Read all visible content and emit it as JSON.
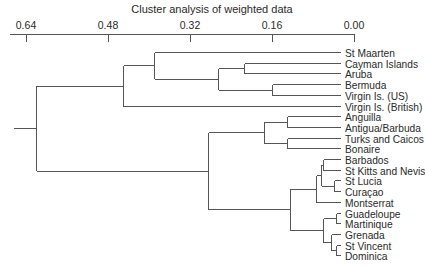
{
  "chart_data": {
    "type": "dendrogram",
    "title": "Cluster analysis of weighted data",
    "xlabel": "",
    "ylabel": "",
    "axis": {
      "position": "top",
      "direction": "reversed",
      "range": [
        0.64,
        0.0
      ],
      "ticks": [
        0.64,
        0.48,
        0.32,
        0.16,
        0.0
      ],
      "tick_labels": [
        "0.64",
        "0.48",
        "0.32",
        "0.16",
        "0.00"
      ]
    },
    "grid": false,
    "legend": null,
    "leaves": [
      "St Maarten",
      "Cayman Islands",
      "Aruba",
      "Bermuda",
      "Virgin Is. (US)",
      "Virgin Is. (British)",
      "Anguilla",
      "Antigua/Barbuda",
      "Turks and Caicos",
      "Bonaire",
      "Barbados",
      "St Kitts and Nevis",
      "St Lucia",
      "Curaçao",
      "Montserrat",
      "Guadeloupe",
      "Martinique",
      "Grenada",
      "St Vincent",
      "Dominica"
    ],
    "merges": [
      {
        "id": "n1",
        "children": [
          "Bermuda",
          "Virgin Is. (US)"
        ],
        "height": 0.16
      },
      {
        "id": "n2",
        "children": [
          "Cayman Islands",
          "Aruba"
        ],
        "height": 0.215
      },
      {
        "id": "n3",
        "children": [
          "n2",
          "n1"
        ],
        "height": 0.265
      },
      {
        "id": "n4",
        "children": [
          "St Maarten",
          "n3"
        ],
        "height": 0.39
      },
      {
        "id": "n5",
        "children": [
          "n4",
          "Virgin Is. (British)"
        ],
        "height": 0.45
      },
      {
        "id": "n6",
        "children": [
          "Anguilla",
          "Antigua/Barbuda"
        ],
        "height": 0.13
      },
      {
        "id": "n7",
        "children": [
          "Turks and Caicos",
          "Bonaire"
        ],
        "height": 0.13
      },
      {
        "id": "n8",
        "children": [
          "n6",
          "n7"
        ],
        "height": 0.175
      },
      {
        "id": "n9",
        "children": [
          "Barbados",
          "St Kitts and Nevis"
        ],
        "height": 0.06
      },
      {
        "id": "n10",
        "children": [
          "St Lucia",
          "Curaçao"
        ],
        "height": 0.04
      },
      {
        "id": "n11",
        "children": [
          "n9",
          "n10"
        ],
        "height": 0.065
      },
      {
        "id": "n12",
        "children": [
          "n11",
          "Montserrat"
        ],
        "height": 0.075
      },
      {
        "id": "n13",
        "children": [
          "Guadeloupe",
          "Martinique"
        ],
        "height": 0.035
      },
      {
        "id": "n14",
        "children": [
          "St Vincent",
          "Dominica"
        ],
        "height": 0.035
      },
      {
        "id": "n15",
        "children": [
          "Grenada",
          "n14"
        ],
        "height": 0.045
      },
      {
        "id": "n16",
        "children": [
          "n13",
          "n15"
        ],
        "height": 0.06
      },
      {
        "id": "n17",
        "children": [
          "n12",
          "n16"
        ],
        "height": 0.125
      },
      {
        "id": "n18",
        "children": [
          "n8",
          "n17"
        ],
        "height": 0.285
      },
      {
        "id": "n19",
        "children": [
          "n5",
          "n18"
        ],
        "height": 0.62
      }
    ]
  }
}
